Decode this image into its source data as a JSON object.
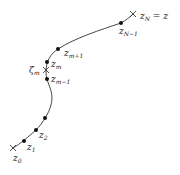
{
  "diagram": {
    "colors": {
      "curve": "#333333",
      "points": "#111111",
      "background": "#ffffff"
    },
    "endpoints": [
      {
        "id": "start",
        "base": "z",
        "sub": "0",
        "suffix": "",
        "marker": "cross"
      },
      {
        "id": "end",
        "base": "z",
        "sub": "N",
        "suffix": " = z",
        "marker": "cross"
      }
    ],
    "points": [
      {
        "id": "z1",
        "base": "z",
        "sub": "1"
      },
      {
        "id": "z2",
        "base": "z",
        "sub": "2"
      },
      {
        "id": "zm-1",
        "base": "z",
        "sub": "m−1"
      },
      {
        "id": "zm",
        "base": "z",
        "sub": "m"
      },
      {
        "id": "zm+1",
        "base": "z",
        "sub": "m+1"
      },
      {
        "id": "zN-1",
        "base": "z",
        "sub": "N−1"
      }
    ],
    "intermediate": {
      "id": "zeta-m",
      "base": "ζ",
      "sub": "m",
      "marker": "cross"
    }
  }
}
